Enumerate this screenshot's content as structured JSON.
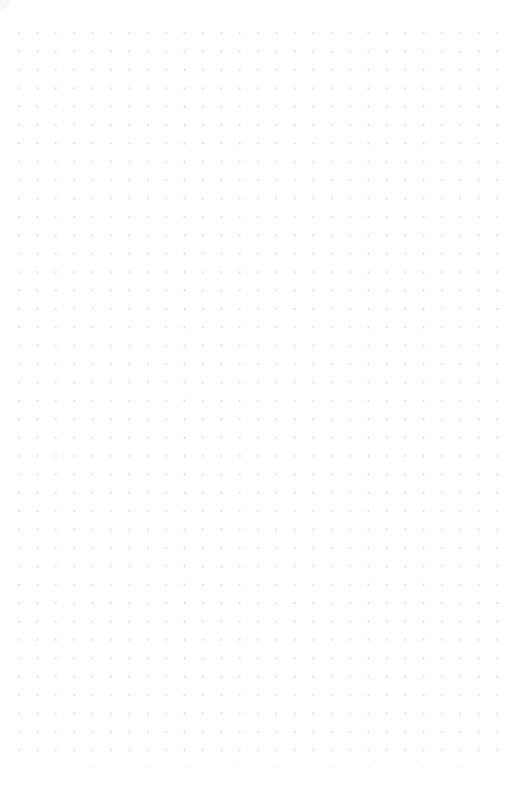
{
  "canvas": {
    "type": "dot-grid",
    "background_color": "#ffffff",
    "dot_color": "#cfcfcf",
    "columns": 27,
    "rows": 40,
    "spacing_px": 18.4
  }
}
